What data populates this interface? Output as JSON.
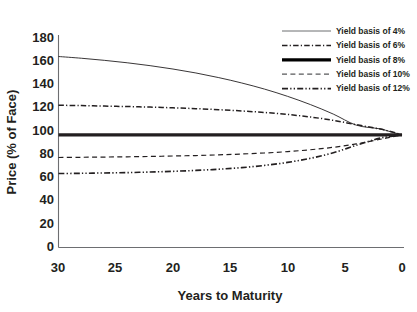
{
  "chart_data": {
    "type": "line",
    "title": "",
    "xlabel": "Years to Maturity",
    "ylabel": "Price (% of Face)",
    "xlim": [
      30,
      0
    ],
    "ylim": [
      0,
      180
    ],
    "x_ticks": [
      "30",
      "25",
      "20",
      "15",
      "10",
      "5",
      "0"
    ],
    "x_tick_values": [
      30,
      25,
      20,
      15,
      10,
      5,
      0
    ],
    "y_ticks": [
      "0",
      "20",
      "40",
      "60",
      "80",
      "100",
      "120",
      "140",
      "160",
      "180"
    ],
    "y_tick_values": [
      0,
      20,
      40,
      60,
      80,
      100,
      120,
      140,
      160,
      180
    ],
    "x_axis_reversed": true,
    "grid": false,
    "legend_position": "top-right",
    "x": [
      30,
      28,
      26,
      24,
      22,
      20,
      18,
      16,
      14,
      12,
      10,
      8,
      6,
      4,
      2,
      1,
      0
    ],
    "series": [
      {
        "name": "Yield basis of 4%",
        "line_style": "solid",
        "line_width": 0.9,
        "color": "#231f20",
        "values": [
          164.5,
          163.0,
          161.2,
          159.1,
          156.6,
          153.7,
          150.3,
          146.3,
          141.7,
          136.4,
          130.2,
          123.1,
          114.9,
          105.4,
          102.3,
          99.7,
          97.0
        ]
      },
      {
        "name": "Yield basis of 6%",
        "line_style": "dash-dot",
        "line_width": 1.5,
        "color": "#231f20",
        "values": [
          122.5,
          122.2,
          121.8,
          121.4,
          120.9,
          120.3,
          119.6,
          118.7,
          117.6,
          116.3,
          114.6,
          112.4,
          109.5,
          105.8,
          102.2,
          99.9,
          97.0
        ]
      },
      {
        "name": "Yield basis of 8%",
        "line_style": "solid",
        "line_width": 3.2,
        "color": "#000000",
        "values": [
          97.0,
          97.0,
          97.0,
          97.0,
          97.0,
          97.0,
          97.0,
          97.0,
          97.0,
          97.0,
          97.0,
          97.0,
          97.0,
          97.0,
          97.0,
          97.0,
          97.0
        ]
      },
      {
        "name": "Yield basis of 10%",
        "line_style": "dashed",
        "line_width": 1.2,
        "color": "#58595b",
        "values": [
          77.5,
          77.7,
          77.9,
          78.1,
          78.4,
          78.8,
          79.2,
          79.8,
          80.5,
          81.4,
          82.6,
          84.2,
          86.3,
          89.2,
          93.0,
          95.0,
          97.0
        ]
      },
      {
        "name": "Yield basis of 12%",
        "line_style": "dash-dot-dot",
        "line_width": 1.6,
        "color": "#231f20",
        "values": [
          63.7,
          63.9,
          64.2,
          64.5,
          65.0,
          65.6,
          66.4,
          67.4,
          68.8,
          70.7,
          73.3,
          76.8,
          81.6,
          88.0,
          94.0,
          95.6,
          97.0
        ]
      }
    ],
    "legend": [
      {
        "label": "Yield basis of 4%",
        "line_style": "solid",
        "line_width": 1.0,
        "color": "#6d6e71"
      },
      {
        "label": "Yield basis of 6%",
        "line_style": "dash-dot",
        "line_width": 1.5,
        "color": "#231f20"
      },
      {
        "label": "Yield basis of 8%",
        "line_style": "solid",
        "line_width": 3.2,
        "color": "#000000"
      },
      {
        "label": "Yield basis of 10%",
        "line_style": "dashed",
        "line_width": 1.3,
        "color": "#58595b"
      },
      {
        "label": "Yield basis of 12%",
        "line_style": "dash-dot-dot",
        "line_width": 1.6,
        "color": "#231f20"
      }
    ]
  }
}
